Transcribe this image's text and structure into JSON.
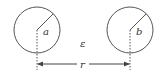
{
  "diagram": {
    "type": "two-circles-distance",
    "stroke_color": "#555555",
    "circles": [
      {
        "id": "left",
        "label": "a",
        "cx": 37,
        "cy": 30,
        "r": 23
      },
      {
        "id": "right",
        "label": "b",
        "cx": 130,
        "cy": 30,
        "r": 23
      }
    ],
    "gap_label": "ε",
    "distance_label": "r"
  }
}
